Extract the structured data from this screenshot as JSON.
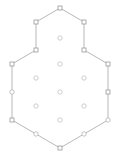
{
  "figure": {
    "title": "",
    "background_color": "#ffffff",
    "width": 120,
    "height": 160
  },
  "style": {
    "edge_color": "#b0b0b0",
    "edge_width": 0.9,
    "boundary_node_stroke": "#9a9a9a",
    "boundary_node_fill": "#ffffff",
    "boundary_node_size": 4,
    "interior_node_stroke": "#c2c2c2",
    "interior_node_fill": "#ffffff",
    "interior_node_radius": 2.2,
    "ring_node_stroke": "#b4b4b4"
  },
  "chart_data": {
    "type": "scatter",
    "title": "",
    "xlabel": "",
    "ylabel": "",
    "xlim": [
      0,
      120
    ],
    "ylim": [
      0,
      160
    ],
    "grid": false,
    "legend": "none",
    "nodes": [
      {
        "id": "b0",
        "label": "top-vertex",
        "x": 60,
        "y": 8,
        "shape": "square",
        "group": "boundary"
      },
      {
        "id": "b1",
        "label": "upper-right-bend",
        "x": 84,
        "y": 22,
        "shape": "square",
        "group": "boundary"
      },
      {
        "id": "b2",
        "label": "right-upper-mid",
        "x": 84,
        "y": 50,
        "shape": "square",
        "group": "boundary"
      },
      {
        "id": "b3",
        "label": "right-vertex",
        "x": 108,
        "y": 64,
        "shape": "square",
        "group": "boundary"
      },
      {
        "id": "b4",
        "label": "right-mid",
        "x": 108,
        "y": 92,
        "shape": "square",
        "group": "boundary"
      },
      {
        "id": "b5",
        "label": "right-lower",
        "x": 108,
        "y": 120,
        "shape": "circle",
        "group": "boundary"
      },
      {
        "id": "b6",
        "label": "lower-right-bend",
        "x": 84,
        "y": 134,
        "shape": "circle",
        "group": "boundary"
      },
      {
        "id": "b7",
        "label": "bottom-vertex",
        "x": 60,
        "y": 148,
        "shape": "square",
        "group": "boundary"
      },
      {
        "id": "b8",
        "label": "lower-left-bend",
        "x": 36,
        "y": 134,
        "shape": "circle",
        "group": "boundary"
      },
      {
        "id": "b9",
        "label": "left-lower",
        "x": 12,
        "y": 120,
        "shape": "square",
        "group": "boundary"
      },
      {
        "id": "b10",
        "label": "left-mid",
        "x": 12,
        "y": 92,
        "shape": "circle",
        "group": "boundary"
      },
      {
        "id": "b11",
        "label": "left-vertex",
        "x": 12,
        "y": 64,
        "shape": "square",
        "group": "boundary"
      },
      {
        "id": "b12",
        "label": "left-upper-mid",
        "x": 36,
        "y": 50,
        "shape": "square",
        "group": "boundary"
      },
      {
        "id": "b13",
        "label": "upper-left-bend",
        "x": 36,
        "y": 22,
        "shape": "square",
        "group": "boundary"
      },
      {
        "id": "i0",
        "label": "interior-top",
        "x": 60,
        "y": 38,
        "shape": "circle",
        "group": "interior"
      },
      {
        "id": "i1",
        "label": "interior-upper-center",
        "x": 60,
        "y": 64,
        "shape": "circle",
        "group": "interior"
      },
      {
        "id": "i2",
        "label": "interior-upper-left",
        "x": 36,
        "y": 78,
        "shape": "circle",
        "group": "interior"
      },
      {
        "id": "i3",
        "label": "interior-upper-right",
        "x": 84,
        "y": 78,
        "shape": "circle",
        "group": "interior"
      },
      {
        "id": "i4",
        "label": "interior-center",
        "x": 60,
        "y": 92,
        "shape": "circle",
        "group": "interior"
      },
      {
        "id": "i5",
        "label": "interior-lower-left",
        "x": 36,
        "y": 106,
        "shape": "circle",
        "group": "interior"
      },
      {
        "id": "i6",
        "label": "interior-lower-right",
        "x": 84,
        "y": 106,
        "shape": "circle",
        "group": "interior"
      },
      {
        "id": "i7",
        "label": "interior-bottom",
        "x": 60,
        "y": 120,
        "shape": "circle",
        "group": "interior"
      }
    ],
    "edges": [
      {
        "from": "b0",
        "to": "b1"
      },
      {
        "from": "b1",
        "to": "b2"
      },
      {
        "from": "b2",
        "to": "b3"
      },
      {
        "from": "b3",
        "to": "b4"
      },
      {
        "from": "b4",
        "to": "b5"
      },
      {
        "from": "b5",
        "to": "b6"
      },
      {
        "from": "b6",
        "to": "b7"
      },
      {
        "from": "b7",
        "to": "b8"
      },
      {
        "from": "b8",
        "to": "b9"
      },
      {
        "from": "b9",
        "to": "b10"
      },
      {
        "from": "b10",
        "to": "b11"
      },
      {
        "from": "b11",
        "to": "b12"
      },
      {
        "from": "b12",
        "to": "b13"
      },
      {
        "from": "b13",
        "to": "b0"
      }
    ]
  }
}
